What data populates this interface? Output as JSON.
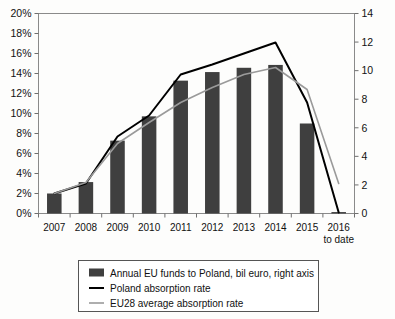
{
  "chart_data": {
    "type": "bar",
    "title": "",
    "subtitle": "",
    "xlabel": "",
    "ylabel": "",
    "grid": false,
    "legend_position": "bottom",
    "categories": [
      "2007",
      "2008",
      "2009",
      "2010",
      "2011",
      "2012",
      "2013",
      "2014",
      "2015",
      "2016 to date"
    ],
    "x_tick_labels": [
      "2007",
      "2008",
      "2009",
      "2010",
      "2011",
      "2012",
      "2013",
      "2014",
      "2015",
      "2016"
    ],
    "x_tick_label_second_line": "to date",
    "left_axis": {
      "label": "",
      "ylim": [
        0,
        20
      ],
      "tick_step": 2,
      "tick_labels": [
        "0%",
        "2%",
        "4%",
        "6%",
        "8%",
        "10%",
        "12%",
        "14%",
        "16%",
        "18%",
        "20%"
      ],
      "unit": "%"
    },
    "right_axis": {
      "label": "",
      "ylim": [
        0,
        14
      ],
      "tick_step": 2,
      "tick_labels": [
        "0",
        "2",
        "4",
        "6",
        "8",
        "10",
        "12",
        "14"
      ],
      "unit": "bil euro"
    },
    "series": [
      {
        "name": "Annual EU funds to Poland, bil euro, right axis",
        "type": "bar",
        "axis": "right",
        "color": "#3f3f3f",
        "values": [
          1.4,
          2.2,
          5.1,
          6.8,
          9.3,
          9.9,
          10.2,
          10.4,
          6.3,
          0.1
        ]
      },
      {
        "name": "Poland absorption rate",
        "type": "line",
        "axis": "left",
        "color": "#000000",
        "values": [
          2.0,
          3.0,
          7.7,
          9.8,
          13.9,
          14.9,
          16.0,
          17.1,
          11.1,
          0.1
        ]
      },
      {
        "name": "EU28 average absorption rate",
        "type": "line",
        "axis": "left",
        "color": "#9a9a9a",
        "values": [
          2.0,
          3.1,
          7.0,
          9.1,
          11.1,
          12.6,
          13.9,
          14.6,
          12.4,
          3.0
        ]
      }
    ],
    "legend": [
      {
        "label": "Annual EU funds to Poland, bil euro, right axis",
        "marker": "swatch",
        "color": "#3f3f3f"
      },
      {
        "label": "Poland absorption rate",
        "marker": "line",
        "color": "#000000"
      },
      {
        "label": "EU28 average absorption rate",
        "marker": "line",
        "color": "#9a9a9a"
      }
    ]
  }
}
